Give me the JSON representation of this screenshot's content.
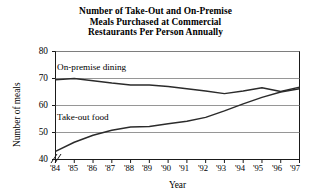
{
  "chart_data": {
    "type": "line",
    "title": "Number of Take-Out and On-Premise Meals Purchased at Commercial Restaurants Per Person Annually",
    "title_lines": [
      "Number of Take-Out and On-Premise",
      "Meals Purchased at Commercial",
      "Restaurants Per Person Annually"
    ],
    "xlabel": "Year",
    "ylabel": "Number of meals",
    "x": [
      "'84",
      "'85",
      "'86",
      "'87",
      "'88",
      "'89",
      "'90",
      "'91",
      "'92",
      "'93",
      "'94",
      "'95",
      "'96",
      "'97"
    ],
    "xtick_labels": [
      "'84",
      "'85",
      "'86",
      "'87",
      "'88",
      "'89",
      "'90",
      "'91",
      "'92",
      "'93",
      "'94",
      "'95",
      "'96",
      "'97"
    ],
    "ytick_labels": [
      "40",
      "50",
      "60",
      "70",
      "80"
    ],
    "yticks": [
      40,
      50,
      60,
      70,
      80
    ],
    "ylim": [
      40,
      80
    ],
    "xlim": [
      "'84",
      "'97"
    ],
    "axis_break": true,
    "axis_break_symbol": "//",
    "grid": "horizontal",
    "gridlines": [
      50,
      60,
      70,
      80
    ],
    "legend_position": "inline-labels",
    "series": [
      {
        "name": "On-premise dining",
        "label_x": "'84",
        "values": [
          69.5,
          70.0,
          69.2,
          68.3,
          67.6,
          67.6,
          67.0,
          66.2,
          65.4,
          64.4,
          65.4,
          66.6,
          65.2,
          66.8
        ],
        "color": "#2b2b2b"
      },
      {
        "name": "Take-out food",
        "label_x": "'84",
        "values": [
          43.0,
          46.4,
          49.0,
          50.8,
          52.0,
          52.2,
          53.2,
          54.2,
          55.6,
          58.0,
          60.6,
          63.0,
          65.0,
          66.2
        ],
        "color": "#2b2b2b"
      }
    ],
    "colors": {
      "background": "#ffffff",
      "axis": "#1a1a1a",
      "grid": "#8a8a8a",
      "text": "#000000",
      "line": "#2b2b2b"
    }
  }
}
